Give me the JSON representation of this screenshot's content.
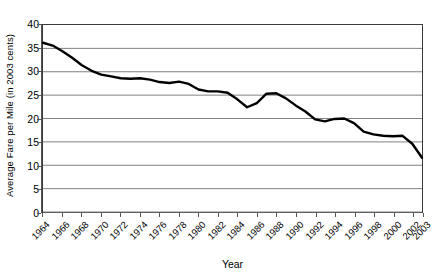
{
  "chart_data": {
    "type": "line",
    "title": "",
    "xlabel": "Year",
    "ylabel": "Average Fare per Mile (in 2003 cents)",
    "xlim": [
      1964,
      2003
    ],
    "ylim": [
      0,
      40
    ],
    "yticks": [
      0,
      5,
      10,
      15,
      20,
      25,
      30,
      35,
      40
    ],
    "xtick_labels": [
      "1964",
      "1966",
      "1968",
      "1970",
      "1972",
      "1974",
      "1976",
      "1978",
      "1980",
      "1982",
      "1984",
      "1986",
      "1988",
      "1990",
      "1992",
      "1994",
      "1996",
      "1998",
      "2000",
      "2002",
      "2003"
    ],
    "xtick_values": [
      1964,
      1966,
      1968,
      1970,
      1972,
      1974,
      1976,
      1978,
      1980,
      1982,
      1984,
      1986,
      1988,
      1990,
      1992,
      1994,
      1996,
      1998,
      2000,
      2002,
      2003
    ],
    "grid": "horizontal",
    "legend": "none",
    "line_color": "#000000",
    "grid_color": "#808080",
    "frame_color": "#3a3a3a",
    "series": [
      {
        "name": "Average Fare per Mile",
        "x": [
          1964,
          1965,
          1966,
          1967,
          1968,
          1969,
          1970,
          1971,
          1972,
          1973,
          1974,
          1975,
          1976,
          1977,
          1978,
          1979,
          1980,
          1981,
          1982,
          1983,
          1984,
          1985,
          1986,
          1987,
          1988,
          1989,
          1990,
          1991,
          1992,
          1993,
          1994,
          1995,
          1996,
          1997,
          1998,
          1999,
          2000,
          2001,
          2002,
          2003
        ],
        "values": [
          36.2,
          35.6,
          34.4,
          33.0,
          31.4,
          30.2,
          29.4,
          29.0,
          28.6,
          28.5,
          28.6,
          28.3,
          27.8,
          27.6,
          27.9,
          27.4,
          26.2,
          25.8,
          25.8,
          25.5,
          24.1,
          22.4,
          23.3,
          25.3,
          25.4,
          24.3,
          22.8,
          21.5,
          19.8,
          19.4,
          19.9,
          20.0,
          19.0,
          17.2,
          16.6,
          16.3,
          16.2,
          16.3,
          14.6,
          11.6
        ]
      }
    ]
  }
}
